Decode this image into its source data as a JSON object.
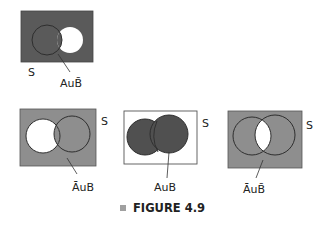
{
  "figure": {
    "caption": "FIGURE 4.9",
    "bullet_color": "#a0a0a0"
  },
  "colors": {
    "dark_fill": "#5a5a5a",
    "medium_fill": "#8e8e8e",
    "white": "#ffffff",
    "stroke": "#333333"
  },
  "diagrams": [
    {
      "id": "top",
      "universe_label": "S",
      "set_label_prefix": "AuB",
      "label_text": "AuB̄",
      "description": "Shaded: A union complement of B"
    },
    {
      "id": "bottom-left",
      "universe_label": "S",
      "label_text": "ĀuB",
      "description": "Shaded: complement of A union B"
    },
    {
      "id": "bottom-center",
      "universe_label": "S",
      "label_text": "AuB",
      "description": "Shaded: A union B"
    },
    {
      "id": "bottom-right",
      "universe_label": "S",
      "label_text": "ĀuB̄",
      "description": "Shaded: complement of A union complement of B"
    }
  ]
}
